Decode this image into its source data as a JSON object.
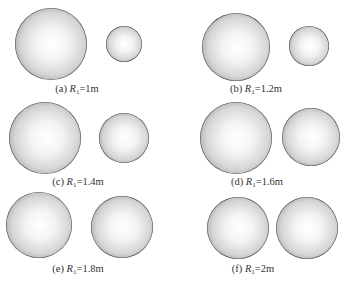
{
  "figure": {
    "panels": [
      {
        "id": "a",
        "label": "(a)",
        "var": "R",
        "sub": "1",
        "value": "=1m",
        "spheres": [
          {
            "cx": 51,
            "cy": 44,
            "r": 36
          },
          {
            "cx": 124,
            "cy": 44,
            "r": 18
          }
        ],
        "caption_pos": {
          "x": 77,
          "y": 83
        }
      },
      {
        "id": "b",
        "label": "(b)",
        "var": "R",
        "sub": "1",
        "value": "=1.2m",
        "spheres": [
          {
            "cx": 236,
            "cy": 47,
            "r": 34
          },
          {
            "cx": 309,
            "cy": 46,
            "r": 20
          }
        ],
        "caption_pos": {
          "x": 256,
          "y": 83
        }
      },
      {
        "id": "c",
        "label": "(c)",
        "var": "R",
        "sub": "1",
        "value": "=1.4m",
        "spheres": [
          {
            "cx": 45,
            "cy": 138,
            "r": 36
          },
          {
            "cx": 124,
            "cy": 138,
            "r": 25
          }
        ],
        "caption_pos": {
          "x": 78,
          "y": 176
        }
      },
      {
        "id": "d",
        "label": "(d)",
        "var": "R",
        "sub": "1",
        "value": "=1.6m",
        "spheres": [
          {
            "cx": 236,
            "cy": 138,
            "r": 36
          },
          {
            "cx": 311,
            "cy": 137,
            "r": 29
          }
        ],
        "caption_pos": {
          "x": 257,
          "y": 176
        }
      },
      {
        "id": "e",
        "label": "(e)",
        "var": "R",
        "sub": "1",
        "value": "=1.8m",
        "spheres": [
          {
            "cx": 39,
            "cy": 225,
            "r": 33
          },
          {
            "cx": 122,
            "cy": 227,
            "r": 31
          }
        ],
        "caption_pos": {
          "x": 78,
          "y": 263
        }
      },
      {
        "id": "f",
        "label": "(f)",
        "var": "R",
        "sub": "1",
        "value": "=2m",
        "spheres": [
          {
            "cx": 238,
            "cy": 228,
            "r": 31
          },
          {
            "cx": 307,
            "cy": 228,
            "r": 31
          }
        ],
        "caption_pos": {
          "x": 253,
          "y": 263
        }
      }
    ]
  }
}
